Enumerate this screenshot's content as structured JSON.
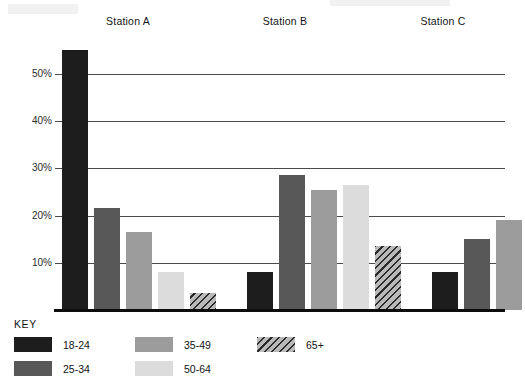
{
  "chart_data": {
    "type": "bar",
    "title": "",
    "subtitle": "",
    "xlabel": "",
    "ylabel": "",
    "categories": [
      "Station A",
      "Station B",
      "Station C"
    ],
    "series": [
      {
        "name": "18-24",
        "color": "#1d1d1d",
        "fill": "solid",
        "values": [
          55,
          8,
          8
        ]
      },
      {
        "name": "25-34",
        "color": "#585858",
        "fill": "solid",
        "values": [
          21.5,
          28.5,
          15
        ]
      },
      {
        "name": "35-49",
        "color": "#9c9c9c",
        "fill": "solid",
        "values": [
          16.5,
          25.5,
          19
        ]
      },
      {
        "name": "50-64",
        "color": "#dcdcdc",
        "fill": "solid",
        "values": [
          8,
          26.5,
          27
        ]
      },
      {
        "name": "65+",
        "color": "#b9b9b9",
        "fill": "diagonal-hatch",
        "values": [
          3.5,
          13.5,
          35
        ]
      }
    ],
    "ylim": [
      0,
      58
    ],
    "yticks": [
      10,
      20,
      30,
      40,
      50
    ],
    "ytick_labels": [
      "10%",
      "20%",
      "30%",
      "40%",
      "50%"
    ],
    "grid": true,
    "grid_axis": "y",
    "legend_position": "bottom-left",
    "legend_title": "KEY",
    "value_unit": "percent"
  },
  "legend": {
    "title": "KEY",
    "items": [
      {
        "label": "18-24"
      },
      {
        "label": "25-34"
      },
      {
        "label": "35-49"
      },
      {
        "label": "50-64"
      },
      {
        "label": "65+"
      }
    ]
  },
  "axis": {
    "y_labels": [
      "50%",
      "40%",
      "30%",
      "20%",
      "10%"
    ]
  },
  "groups": [
    {
      "label": "Station A"
    },
    {
      "label": "Station B"
    },
    {
      "label": "Station C"
    }
  ]
}
